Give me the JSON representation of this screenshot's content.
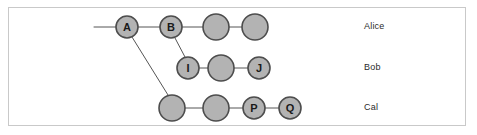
{
  "figure": {
    "kind": "commit-graph-diagram",
    "background_color": "#ffffff",
    "frame": {
      "border_color": "#c9c9c9",
      "x": 8,
      "y": 7,
      "width": 458,
      "height": 119
    },
    "node_style": {
      "fill_color": "#b3b3b3",
      "stroke_color": "#4d4d4d",
      "label_color": "#1a1a1a"
    },
    "edge_style": {
      "stroke_color": "#555555",
      "stroke_width": 1
    }
  },
  "lanes": [
    {
      "id": "alice",
      "label": "Alice",
      "y": 27,
      "label_x": 364,
      "label_y": 27
    },
    {
      "id": "bob",
      "label": "Bob",
      "y": 68,
      "label_x": 364,
      "label_y": 68
    },
    {
      "id": "cal",
      "label": "Cal",
      "y": 108,
      "label_x": 364,
      "label_y": 108
    }
  ],
  "nodes": [
    {
      "id": "a",
      "label": "A",
      "lane": "alice",
      "cx": 127,
      "cy": 27,
      "r": 11
    },
    {
      "id": "b",
      "label": "B",
      "lane": "alice",
      "cx": 171,
      "cy": 27,
      "r": 11
    },
    {
      "id": "c1",
      "label": "",
      "lane": "alice",
      "cx": 216,
      "cy": 27,
      "r": 13
    },
    {
      "id": "c2",
      "label": "",
      "lane": "alice",
      "cx": 255,
      "cy": 27,
      "r": 13
    },
    {
      "id": "i",
      "label": "I",
      "lane": "bob",
      "cx": 188,
      "cy": 68,
      "r": 11
    },
    {
      "id": "i2",
      "label": "",
      "lane": "bob",
      "cx": 221,
      "cy": 68,
      "r": 13
    },
    {
      "id": "j",
      "label": "J",
      "lane": "bob",
      "cx": 259,
      "cy": 68,
      "r": 11
    },
    {
      "id": "p1",
      "label": "",
      "lane": "cal",
      "cx": 172,
      "cy": 108,
      "r": 13
    },
    {
      "id": "p2",
      "label": "",
      "lane": "cal",
      "cx": 216,
      "cy": 108,
      "r": 13
    },
    {
      "id": "p",
      "label": "P",
      "lane": "cal",
      "cx": 254,
      "cy": 108,
      "r": 11
    },
    {
      "id": "q",
      "label": "Q",
      "lane": "cal",
      "cx": 290,
      "cy": 108,
      "r": 11
    }
  ],
  "edges": [
    {
      "from": "stub-left",
      "to": "a",
      "x1": 94,
      "y1": 27,
      "x2": 116,
      "y2": 27
    },
    {
      "from": "a",
      "to": "b",
      "x1": 138,
      "y1": 27,
      "x2": 160,
      "y2": 27
    },
    {
      "from": "b",
      "to": "c1",
      "x1": 182,
      "y1": 27,
      "x2": 203,
      "y2": 27
    },
    {
      "from": "c1",
      "to": "c2",
      "x1": 229,
      "y1": 27,
      "x2": 242,
      "y2": 27
    },
    {
      "from": "b",
      "to": "i",
      "x1": 175,
      "y1": 38,
      "x2": 185,
      "y2": 57
    },
    {
      "from": "i",
      "to": "i2",
      "x1": 199,
      "y1": 68,
      "x2": 208,
      "y2": 68
    },
    {
      "from": "i2",
      "to": "j",
      "x1": 234,
      "y1": 68,
      "x2": 248,
      "y2": 68
    },
    {
      "from": "a",
      "to": "p1",
      "x1": 132,
      "y1": 37,
      "x2": 168,
      "y2": 95
    },
    {
      "from": "p1",
      "to": "p2",
      "x1": 185,
      "y1": 108,
      "x2": 203,
      "y2": 108
    },
    {
      "from": "p2",
      "to": "p",
      "x1": 229,
      "y1": 108,
      "x2": 243,
      "y2": 108
    },
    {
      "from": "p",
      "to": "q",
      "x1": 265,
      "y1": 108,
      "x2": 279,
      "y2": 108
    }
  ]
}
